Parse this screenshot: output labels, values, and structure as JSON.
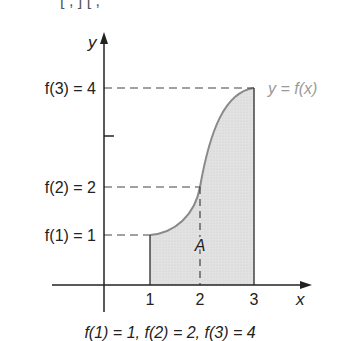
{
  "top_fragment": "[  ,  ]      [  ,",
  "axes": {
    "y_label": "y",
    "x_label": "x"
  },
  "x_ticks": [
    "1",
    "2",
    "3"
  ],
  "y_labels": {
    "f3": "f(3) = 4",
    "f2": "f(2) = 2",
    "f1": "f(1) = 1"
  },
  "curve_label": "y = f(x)",
  "area_label": "A",
  "caption": "f(1) = 1, f(2) = 2, f(3) = 4",
  "colors": {
    "fill": "#dcdcdc",
    "curve": "#8a8a8a",
    "axis": "#222222",
    "label_gray": "#9a9a9a"
  }
}
